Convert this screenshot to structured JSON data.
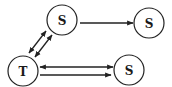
{
  "diagram": {
    "colors": {
      "stroke": "#222222",
      "background": "#ffffff",
      "text": "#1a1a1a"
    },
    "nodes": [
      {
        "id": "s_top",
        "label": "S",
        "cx": 62,
        "cy": 20,
        "r": 15
      },
      {
        "id": "s_right",
        "label": "S",
        "cx": 149,
        "cy": 23,
        "r": 15
      },
      {
        "id": "t",
        "label": "T",
        "cx": 23,
        "cy": 71,
        "r": 15
      },
      {
        "id": "s_bottom",
        "label": "S",
        "cx": 129,
        "cy": 70,
        "r": 15
      }
    ],
    "edges": [
      {
        "id": "s_top-to-s_right",
        "from": "s_top",
        "to": "s_right",
        "arrows": "end"
      },
      {
        "id": "t-s_top-a",
        "from": "t",
        "to": "s_top",
        "arrows": "both"
      },
      {
        "id": "t-s_top-b",
        "from": "t",
        "to": "s_top",
        "arrows": "both"
      },
      {
        "id": "t-s_bottom-a",
        "from": "t",
        "to": "s_bottom",
        "arrows": "both"
      },
      {
        "id": "t-to-s_bottom-b",
        "from": "t",
        "to": "s_bottom",
        "arrows": "end"
      }
    ]
  }
}
